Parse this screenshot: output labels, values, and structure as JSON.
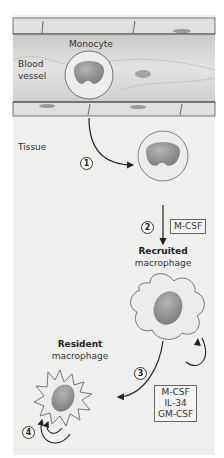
{
  "diagram": {
    "compartments": [
      {
        "id": "blood-vessel",
        "label_line1": "Blood",
        "label_line2": "vessel"
      },
      {
        "id": "tissue",
        "label": "Tissue"
      }
    ],
    "cells": {
      "monocyte": {
        "label": "Monocyte"
      },
      "recruited": {
        "label_bold": "Recruited",
        "label": "macrophage"
      },
      "resident": {
        "label_bold": "Resident",
        "label": "macrophage"
      }
    },
    "steps": [
      {
        "number": "1",
        "description": "Monocyte extravasation from blood vessel into tissue"
      },
      {
        "number": "2",
        "description": "Differentiation into recruited macrophage",
        "factors": [
          "M-CSF"
        ]
      },
      {
        "number": "3",
        "description": "Recruited macrophage becomes resident macrophage",
        "factors": [
          "M-CSF",
          "IL-34",
          "GM-CSF"
        ]
      },
      {
        "number": "4",
        "description": "Resident macrophage self-renewal"
      }
    ],
    "colors": {
      "panel_bg": "#efefee",
      "vessel_bg": "#d9d9d7",
      "cell_fill": "#e6e6e4",
      "nucleus": "#8f8f8f",
      "arrow": "#222222"
    }
  }
}
